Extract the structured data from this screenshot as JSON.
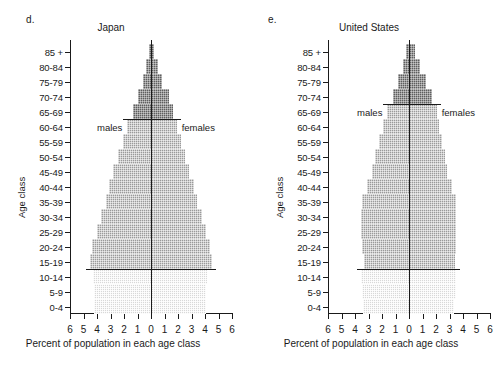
{
  "figure": {
    "panels": [
      {
        "letter": "d.",
        "title": "Japan",
        "males_label": "males",
        "females_label": "females",
        "sex_label_age_class": "60-64"
      },
      {
        "letter": "e.",
        "title": "United States",
        "males_label": "males",
        "females_label": "females",
        "sex_label_age_class": "65-69"
      }
    ],
    "axis": {
      "xlabel": "Percent of population in each age class",
      "ylabel": "Age class",
      "xticks": [
        "6",
        "5",
        "4",
        "3",
        "2",
        "1",
        "0",
        "1",
        "2",
        "3",
        "4",
        "5",
        "6"
      ],
      "age_classes": [
        "85 +",
        "80-84",
        "75-79",
        "70-74",
        "65-69",
        "60-64",
        "55-59",
        "50-54",
        "45-49",
        "40-44",
        "35-39",
        "30-34",
        "25-29",
        "20-24",
        "15-19",
        "10-14",
        "5-9",
        "0-4"
      ]
    },
    "colors": {
      "light": "#d8d8d8",
      "mid": "#9a9a9a",
      "dark": "#5e5e5e",
      "line": "#1a1a1a"
    }
  },
  "chart_data": [
    {
      "type": "bar",
      "subtype": "population-pyramid",
      "panel": "d.",
      "title": "Japan",
      "xlabel": "Percent of population in each age class",
      "ylabel": "Age class",
      "xlim": [
        -6,
        6
      ],
      "xticks": [
        -6,
        -5,
        -4,
        -3,
        -2,
        -1,
        0,
        1,
        2,
        3,
        4,
        5,
        6
      ],
      "xtick_labels": [
        "6",
        "5",
        "4",
        "3",
        "2",
        "1",
        "0",
        "1",
        "2",
        "3",
        "4",
        "5",
        "6"
      ],
      "grid": false,
      "legend": "inline annotations: males (left), females (right)",
      "categories": [
        "85 +",
        "80-84",
        "75-79",
        "70-74",
        "65-69",
        "60-64",
        "55-59",
        "50-54",
        "45-49",
        "40-44",
        "35-39",
        "30-34",
        "25-29",
        "20-24",
        "15-19",
        "10-14",
        "5-9",
        "0-4"
      ],
      "series": [
        {
          "name": "males",
          "side": "left",
          "values": [
            0.15,
            0.35,
            0.6,
            1.0,
            1.35,
            1.75,
            2.1,
            2.45,
            2.8,
            3.1,
            3.35,
            3.7,
            4.0,
            4.4,
            4.55,
            4.3,
            4.2,
            4.25
          ]
        },
        {
          "name": "females",
          "side": "right",
          "values": [
            0.25,
            0.5,
            0.85,
            1.3,
            1.6,
            1.9,
            2.2,
            2.55,
            2.85,
            3.15,
            3.4,
            3.75,
            4.05,
            4.4,
            4.55,
            4.15,
            4.1,
            4.1
          ]
        }
      ],
      "shading": {
        "dark_age_classes": [
          "85 +",
          "80-84",
          "75-79",
          "70-74",
          "65-69"
        ],
        "mid_age_classes": [
          "60-64",
          "55-59",
          "50-54",
          "45-49",
          "40-44",
          "35-39",
          "30-34",
          "25-29",
          "20-24",
          "15-19"
        ],
        "light_age_classes": [
          "10-14",
          "5-9",
          "0-4"
        ]
      }
    },
    {
      "type": "bar",
      "subtype": "population-pyramid",
      "panel": "e.",
      "title": "United States",
      "xlabel": "Percent of population in each age class",
      "ylabel": "Age class",
      "xlim": [
        -6,
        6
      ],
      "xticks": [
        -6,
        -5,
        -4,
        -3,
        -2,
        -1,
        0,
        1,
        2,
        3,
        4,
        5,
        6
      ],
      "xtick_labels": [
        "6",
        "5",
        "4",
        "3",
        "2",
        "1",
        "0",
        "1",
        "2",
        "3",
        "4",
        "5",
        "6"
      ],
      "grid": false,
      "legend": "inline annotations: males (left), females (right)",
      "categories": [
        "85 +",
        "80-84",
        "75-79",
        "70-74",
        "65-69",
        "60-64",
        "55-59",
        "50-54",
        "45-49",
        "40-44",
        "35-39",
        "30-34",
        "25-29",
        "20-24",
        "15-19",
        "10-14",
        "5-9",
        "0-4"
      ],
      "series": [
        {
          "name": "males",
          "side": "left",
          "values": [
            0.2,
            0.45,
            0.8,
            1.2,
            1.6,
            1.9,
            2.2,
            2.5,
            2.75,
            3.1,
            3.5,
            3.55,
            3.55,
            3.5,
            3.3,
            3.55,
            3.5,
            3.4
          ]
        },
        {
          "name": "females",
          "side": "right",
          "values": [
            0.45,
            0.8,
            1.25,
            1.7,
            2.05,
            2.25,
            2.45,
            2.65,
            2.85,
            3.15,
            3.45,
            3.5,
            3.5,
            3.45,
            3.4,
            3.5,
            3.45,
            3.3
          ]
        }
      ],
      "shading": {
        "dark_age_classes": [
          "85 +",
          "80-84",
          "75-79",
          "70-74"
        ],
        "mid_age_classes": [
          "65-69",
          "60-64",
          "55-59",
          "50-54",
          "45-49",
          "40-44",
          "35-39",
          "30-34",
          "25-29",
          "20-24",
          "15-19"
        ],
        "light_age_classes": [
          "10-14",
          "5-9",
          "0-4"
        ]
      }
    }
  ]
}
